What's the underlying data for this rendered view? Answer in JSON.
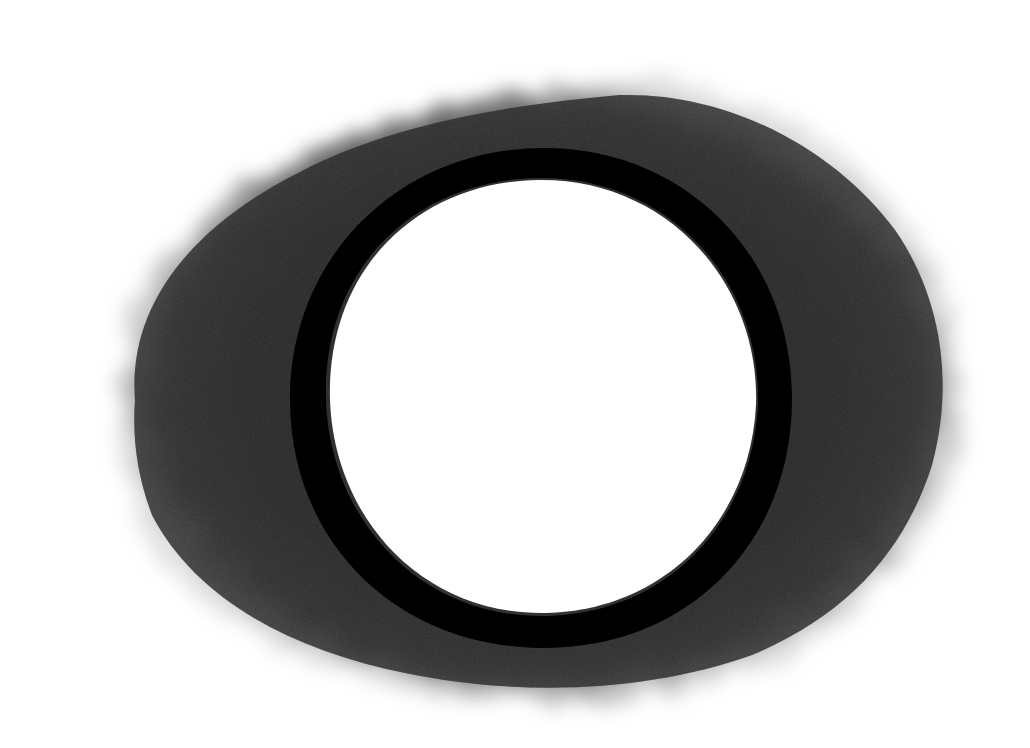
{
  "artwork": {
    "subject": "hand-drawn ring",
    "background_color": "#ffffff",
    "halo": {
      "shape": "irregular oval",
      "color": "#3a3a3a",
      "texture": "graphite shading",
      "center": [
        535,
        395
      ],
      "radius_x": 430,
      "radius_y": 325
    },
    "ring": {
      "shape": "circle",
      "color": "#000000",
      "center": [
        540,
        398
      ],
      "outer_radius_x": 252,
      "outer_radius_y": 252,
      "inner_radius_x": 218,
      "inner_radius_y": 222
    },
    "inner_fill": "#ffffff"
  }
}
